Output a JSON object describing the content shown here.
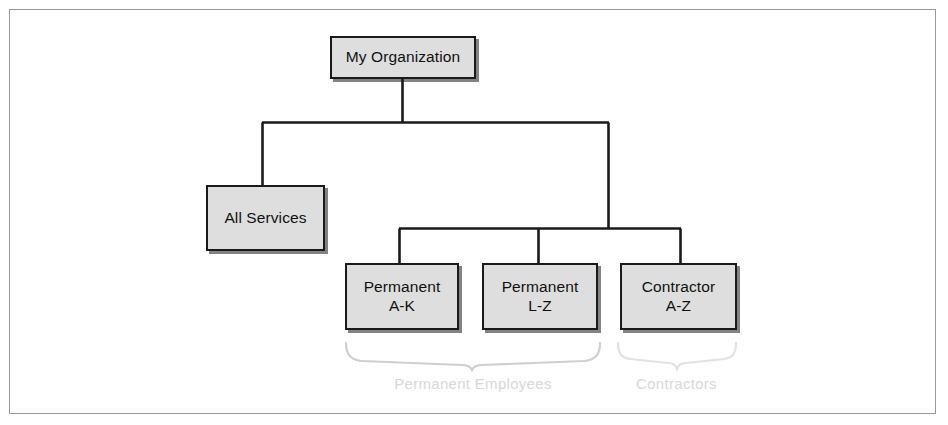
{
  "diagram": {
    "type": "organization-tree",
    "colors": {
      "node_fill": "#dedede",
      "node_border": "#1a1a1a",
      "connector": "#1a1a1a",
      "group_label": "#d8d8d8",
      "frame_border": "#9a9a9a",
      "background": "#ffffff"
    },
    "nodes": {
      "root": {
        "label": "My Organization"
      },
      "all_services": {
        "label": "All Services"
      },
      "permanent_ak": {
        "label": "Permanent\nA-K"
      },
      "permanent_lz": {
        "label": "Permanent\nL-Z"
      },
      "contractor_az": {
        "label": "Contractor\nA-Z"
      }
    },
    "group_labels": {
      "permanent": "Permanent Employees",
      "contractors": "Contractors"
    }
  }
}
